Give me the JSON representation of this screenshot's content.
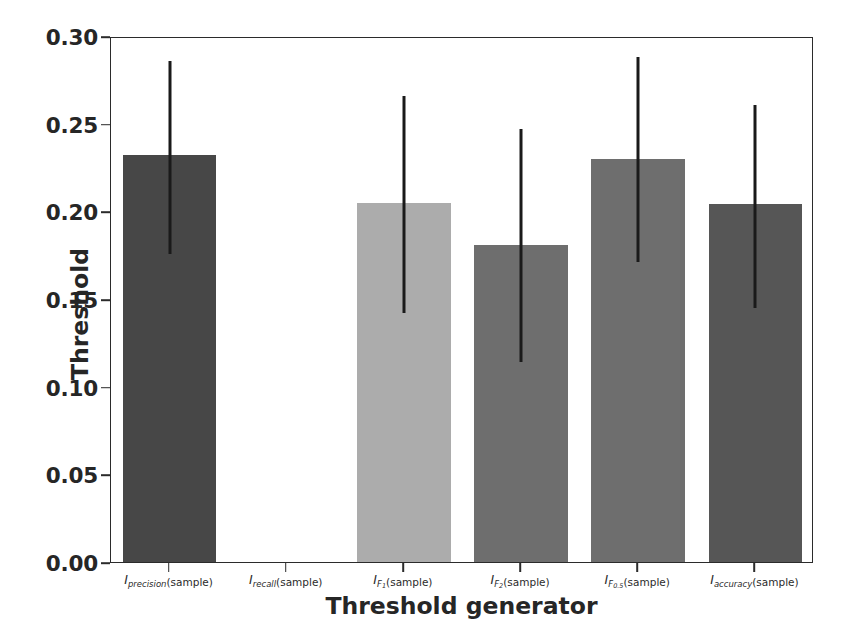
{
  "chart_data": {
    "type": "bar",
    "title": "",
    "xlabel": "Threshold generator",
    "ylabel": "Threshold",
    "ylim": [
      0.0,
      0.3
    ],
    "yticks": [
      "0.00",
      "0.05",
      "0.10",
      "0.15",
      "0.20",
      "0.25",
      "0.30"
    ],
    "ytick_values": [
      0.0,
      0.05,
      0.1,
      0.15,
      0.2,
      0.25,
      0.3
    ],
    "grid": false,
    "legend": "none",
    "categories": [
      "I_precision(sample)",
      "I_recall(sample)",
      "I_F1(sample)",
      "I_F2(sample)",
      "I_F0.5(sample)",
      "I_accuracy(sample)"
    ],
    "category_parts": [
      {
        "base": "I",
        "sub": "precision",
        "paren": "(sample)"
      },
      {
        "base": "I",
        "sub": "recall",
        "paren": "(sample)"
      },
      {
        "base": "I",
        "sub": "F",
        "sub2": "1",
        "paren": "(sample)"
      },
      {
        "base": "I",
        "sub": "F",
        "sub2": "2",
        "paren": "(sample)"
      },
      {
        "base": "I",
        "sub": "F",
        "sub2": "0.5",
        "paren": "(sample)"
      },
      {
        "base": "I",
        "sub": "accuracy",
        "paren": "(sample)"
      }
    ],
    "values": [
      0.232,
      0.0,
      0.205,
      0.181,
      0.23,
      0.204
    ],
    "err_high": [
      0.287,
      0.0,
      0.267,
      0.248,
      0.289,
      0.262
    ],
    "err_low": [
      0.177,
      0.0,
      0.143,
      0.115,
      0.172,
      0.146
    ],
    "bar_colors": [
      "#474747",
      "#474747",
      "#acacac",
      "#6e6e6e",
      "#6e6e6e",
      "#565656"
    ],
    "errorbar_color": "#1a1a1a",
    "axis_color": "#2b2b2b",
    "background_color": "#ffffff"
  }
}
